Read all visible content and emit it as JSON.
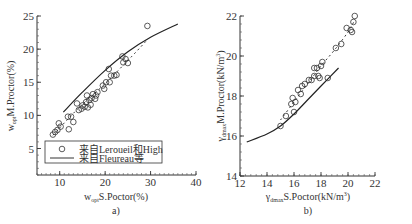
{
  "chart_data": [
    {
      "panel": "a)",
      "type": "scatter",
      "title": "",
      "xlabel": "w_opt S.Poctor(%)",
      "ylabel": "w_opt M.Proctor(%)",
      "xlim": [
        5,
        40
      ],
      "ylim": [
        1,
        25
      ],
      "xticks": [
        10,
        20,
        30,
        40
      ],
      "yticks": [
        5,
        10,
        15,
        20,
        25
      ],
      "grid": false,
      "legend_position": "lower-left inside",
      "legend": [
        {
          "marker": "circle",
          "label": "来自Leroueil和High"
        },
        {
          "marker": "line",
          "label": "来自Fleureau等"
        }
      ],
      "series": [
        {
          "name": "来自Leroueil和High",
          "kind": "scatter",
          "points": [
            [
              8.5,
              7.1
            ],
            [
              9.0,
              7.5
            ],
            [
              9.5,
              7.8
            ],
            [
              9.8,
              8.8
            ],
            [
              10.2,
              8.3
            ],
            [
              11.8,
              9.8
            ],
            [
              12.0,
              7.9
            ],
            [
              12.5,
              9.8
            ],
            [
              13.0,
              9.0
            ],
            [
              13.8,
              11.8
            ],
            [
              14.2,
              10.8
            ],
            [
              14.8,
              11.0
            ],
            [
              15.0,
              11.5
            ],
            [
              15.5,
              11.3
            ],
            [
              15.8,
              12.0
            ],
            [
              16.0,
              13.0
            ],
            [
              16.2,
              11.2
            ],
            [
              16.5,
              12.3
            ],
            [
              16.8,
              11.6
            ],
            [
              17.0,
              12.6
            ],
            [
              17.3,
              13.2
            ],
            [
              17.8,
              12.5
            ],
            [
              18.0,
              13.0
            ],
            [
              18.3,
              13.5
            ],
            [
              19.5,
              14.5
            ],
            [
              19.8,
              14.0
            ],
            [
              20.2,
              15.0
            ],
            [
              20.8,
              17.0
            ],
            [
              21.0,
              15.0
            ],
            [
              21.3,
              16.0
            ],
            [
              22.0,
              16.0
            ],
            [
              22.5,
              16.1
            ],
            [
              23.8,
              18.9
            ],
            [
              24.0,
              18.0
            ],
            [
              24.5,
              18.5
            ],
            [
              25.0,
              17.9
            ],
            [
              29.3,
              23.5
            ]
          ]
        },
        {
          "name": "来自Fleureau等",
          "kind": "line",
          "points": [
            [
              10.8,
              10.5
            ],
            [
              15,
              13.5
            ],
            [
              20,
              16.8
            ],
            [
              25,
              19.6
            ],
            [
              30,
              21.8
            ],
            [
              36,
              23.8
            ]
          ]
        },
        {
          "name": "fit (dashed)",
          "kind": "dashed-line",
          "points": [
            [
              8.5,
              7.0
            ],
            [
              14,
              11.0
            ],
            [
              20,
              14.8
            ],
            [
              26,
              19.0
            ],
            [
              29,
              21.2
            ]
          ]
        }
      ]
    },
    {
      "panel": "b)",
      "type": "scatter",
      "title": "",
      "xlabel": "γ_dmax S.Poctor(kN/m³)",
      "ylabel": "γ_dmax M.Proctor(kN/m³)",
      "xlim": [
        12,
        22
      ],
      "ylim": [
        14,
        22
      ],
      "xticks": [
        12,
        14,
        16,
        18,
        20,
        22
      ],
      "yticks": [
        14,
        16,
        18,
        20,
        22
      ],
      "grid": false,
      "series": [
        {
          "name": "data",
          "kind": "scatter",
          "points": [
            [
              15.0,
              16.5
            ],
            [
              15.4,
              17.0
            ],
            [
              15.8,
              17.6
            ],
            [
              15.9,
              17.9
            ],
            [
              16.0,
              17.2
            ],
            [
              16.1,
              17.7
            ],
            [
              16.3,
              18.3
            ],
            [
              16.5,
              18.1
            ],
            [
              16.6,
              18.5
            ],
            [
              16.8,
              18.6
            ],
            [
              17.1,
              18.8
            ],
            [
              17.3,
              18.8
            ],
            [
              17.5,
              19.4
            ],
            [
              17.5,
              19.0
            ],
            [
              17.7,
              19.4
            ],
            [
              17.8,
              19.0
            ],
            [
              17.9,
              18.9
            ],
            [
              18.0,
              19.5
            ],
            [
              18.1,
              19.7
            ],
            [
              18.5,
              18.9
            ],
            [
              19.1,
              20.4
            ],
            [
              19.5,
              20.6
            ],
            [
              19.9,
              21.4
            ],
            [
              20.2,
              21.3
            ],
            [
              20.3,
              21.2
            ],
            [
              20.4,
              21.7
            ],
            [
              20.5,
              22.0
            ]
          ]
        },
        {
          "name": "curve (solid)",
          "kind": "line",
          "points": [
            [
              12.5,
              15.7
            ],
            [
              14,
              16.1
            ],
            [
              15,
              16.5
            ],
            [
              16,
              17.1
            ],
            [
              17,
              17.8
            ],
            [
              18,
              18.5
            ],
            [
              19.3,
              19.4
            ]
          ]
        },
        {
          "name": "fit (dashed)",
          "kind": "dashed-line",
          "points": [
            [
              15.0,
              16.8
            ],
            [
              16,
              17.7
            ],
            [
              17,
              18.6
            ],
            [
              18,
              19.5
            ],
            [
              19,
              20.3
            ],
            [
              20,
              21.2
            ],
            [
              20.5,
              21.8
            ]
          ]
        }
      ]
    }
  ],
  "panels": {
    "a": {
      "label": "a)",
      "ylabel_main": "M.Proctor(%)",
      "ylabel_prefix": "w",
      "ylabel_sub": "opt",
      "xlabel_main": "S.Poctor(%)",
      "xlabel_prefix": "w",
      "xlabel_sub": "opt",
      "legend_1": "来自Leroueil和High",
      "legend_2": "来自Fleureau等"
    },
    "b": {
      "label": "b)",
      "ylabel_main": "M.Proctor(kN/m",
      "ylabel_prefix": "γ",
      "ylabel_sub": "dmax",
      "xlabel_main": "S.Poctor(kN/m",
      "xlabel_prefix": "γ",
      "xlabel_sub": "dmax",
      "unit_sup": "3",
      "close": ")"
    }
  }
}
